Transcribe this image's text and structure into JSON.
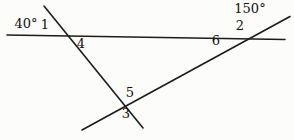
{
  "diagram": {
    "background": "#fcfcfa",
    "line_color": "#1c1c1c",
    "label_color": "#111111",
    "lines": [
      {
        "name": "horizontal-line",
        "x1": 7,
        "y1": 35,
        "x2": 285,
        "y2": 39.5
      },
      {
        "name": "left-transversal",
        "x1": 44,
        "y1": 6,
        "x2": 143,
        "y2": 128
      },
      {
        "name": "right-transversal",
        "x1": 82,
        "y1": 130,
        "x2": 290,
        "y2": 16.5
      }
    ],
    "labels": [
      {
        "name": "angle-label-40deg",
        "text": "40°",
        "x": 26,
        "y": 28
      },
      {
        "name": "angle-label-1",
        "text": "1",
        "x": 45,
        "y": 29
      },
      {
        "name": "angle-label-4",
        "text": "4",
        "x": 81,
        "y": 48
      },
      {
        "name": "angle-label-150deg",
        "text": "150°",
        "x": 250,
        "y": 13
      },
      {
        "name": "angle-label-2",
        "text": "2",
        "x": 240,
        "y": 30
      },
      {
        "name": "angle-label-6",
        "text": "6",
        "x": 216,
        "y": 45
      },
      {
        "name": "angle-label-5",
        "text": "5",
        "x": 130,
        "y": 97
      },
      {
        "name": "angle-label-3",
        "text": "3",
        "x": 126,
        "y": 118
      }
    ]
  }
}
